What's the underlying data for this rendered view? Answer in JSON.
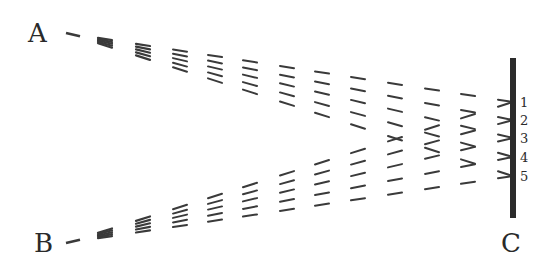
{
  "labels": {
    "source_a": "A",
    "source_b": "B",
    "screen": "C",
    "points": [
      "1",
      "2",
      "3",
      "4",
      "5"
    ]
  },
  "geometry": {
    "source_a": [
      66,
      33
    ],
    "source_b": [
      66,
      243
    ],
    "screen_x": 513,
    "screen_top": 58,
    "screen_bottom": 218,
    "point_ys": [
      102,
      120,
      138,
      157,
      176
    ],
    "dash_columns_x": [
      105,
      143,
      180,
      215,
      250,
      287,
      322,
      358,
      395,
      432,
      468,
      505
    ],
    "dash_length": 14
  },
  "colors": {
    "ink": "#3a3a3a",
    "screen": "#2b2b2b",
    "background": "#ffffff"
  }
}
